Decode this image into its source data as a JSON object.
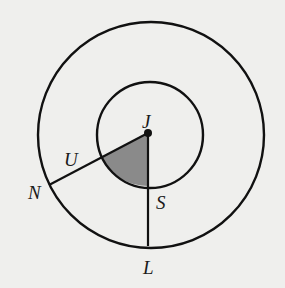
{
  "diagram": {
    "type": "concentric-circles-with-shaded-sector",
    "center": {
      "label": "J",
      "x": 148,
      "y": 133
    },
    "inner_circle": {
      "r": 53
    },
    "outer_circle": {
      "r": 113
    },
    "points": [
      {
        "label": "J",
        "x": 148,
        "y": 122
      },
      {
        "label": "U",
        "x": 72,
        "y": 166
      },
      {
        "label": "N",
        "x": 36,
        "y": 199
      },
      {
        "label": "S",
        "x": 158,
        "y": 207
      },
      {
        "label": "L",
        "x": 142,
        "y": 274
      }
    ],
    "segments": [
      {
        "from": "J",
        "to": "N"
      },
      {
        "from": "J",
        "to": "L"
      }
    ],
    "shaded_region": "sector UJS of inner circle",
    "colors": {
      "stroke": "#111111",
      "shade": "#8a8a8a",
      "background": "#efefed"
    }
  }
}
